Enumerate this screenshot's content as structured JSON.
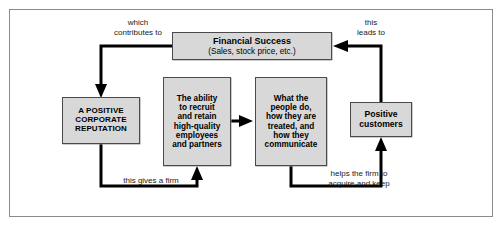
{
  "diagram": {
    "frame": {
      "border_color": "#8a8a8a",
      "background": "#ffffff"
    },
    "style": {
      "node_fill": "#d8d8d8",
      "node_border": "#4a4a4a",
      "arrow_color": "#000000",
      "text_color": "#000000"
    },
    "nodes": [
      {
        "id": "financial-success",
        "title": "Financial Success",
        "subtitle": "(Sales, stock price, etc.)"
      },
      {
        "id": "corporate-reputation",
        "lines": [
          "A POSITIVE",
          "CORPORATE",
          "REPUTATION"
        ]
      },
      {
        "id": "ability-recruit",
        "lines": [
          "The ability",
          "to recruit",
          "and retain",
          "high-quality",
          "employees",
          "and partners"
        ]
      },
      {
        "id": "people-behavior",
        "lines": [
          "What the",
          "people do,",
          "how they are",
          "treated, and",
          "how they",
          "communicate"
        ]
      },
      {
        "id": "positive-customers",
        "lines": [
          "Positive",
          "customers"
        ]
      }
    ],
    "edges": [
      {
        "id": "financial-to-reputation",
        "from": "financial-success",
        "to": "corporate-reputation",
        "label_lines": [
          "which",
          "contributes to"
        ]
      },
      {
        "id": "customers-to-financial",
        "from": "positive-customers",
        "to": "financial-success",
        "label_lines": [
          "this",
          "leads to"
        ]
      },
      {
        "id": "reputation-to-ability",
        "from": "corporate-reputation",
        "to": "ability-recruit",
        "label_lines": [
          "this gives a firm"
        ]
      },
      {
        "id": "ability-to-people",
        "from": "ability-recruit",
        "to": "people-behavior",
        "label_lines": []
      },
      {
        "id": "people-to-customers",
        "from": "people-behavior",
        "to": "positive-customers",
        "label_lines": [
          "helps the firm to",
          "acquire and keep"
        ]
      }
    ]
  }
}
